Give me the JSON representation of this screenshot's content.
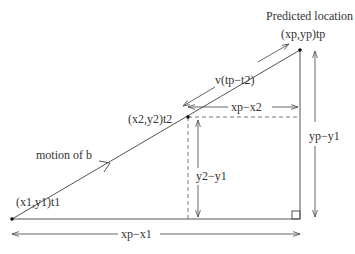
{
  "diagram": {
    "title": "Predicted location",
    "colors": {
      "line": "#555555",
      "text": "#333333",
      "background": "#ffffff"
    },
    "points": {
      "p1": {
        "label": "(x1,y1)t1",
        "x": 12,
        "y": 219
      },
      "p2": {
        "label": "(x2,y2)t2",
        "x": 188,
        "y": 117
      },
      "pp": {
        "label": "(xp,yp)tp",
        "x": 300,
        "y": 50
      }
    },
    "labels": {
      "predicted_location": "Predicted location",
      "predicted_coords": "(xp,yp)tp",
      "p2_coords": "(x2,y2)t2",
      "p1_coords": "(x1,y1)t1",
      "motion": "motion of b",
      "velocity_segment": "v(tp−t2)",
      "dx_total": "xp−x1",
      "dx_partial": "xp−x2",
      "dy_partial": "y2−y1",
      "dy_total": "yp−y1"
    }
  }
}
